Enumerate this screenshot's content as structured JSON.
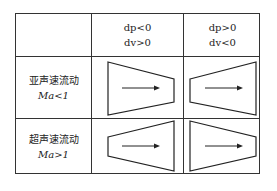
{
  "table": {
    "header": [
      {
        "line1": "dp<0",
        "line2": "dv>0"
      },
      {
        "line1": "dp>0",
        "line2": "dv<0"
      }
    ],
    "rows": [
      {
        "label": "亚声速流动",
        "condition": "Ma<1",
        "nozzle_shapes": [
          "converging",
          "diverging"
        ]
      },
      {
        "label": "超声速流动",
        "condition": "Ma>1",
        "nozzle_shapes": [
          "diverging",
          "converging"
        ]
      }
    ],
    "flow_direction": "left-to-right"
  }
}
